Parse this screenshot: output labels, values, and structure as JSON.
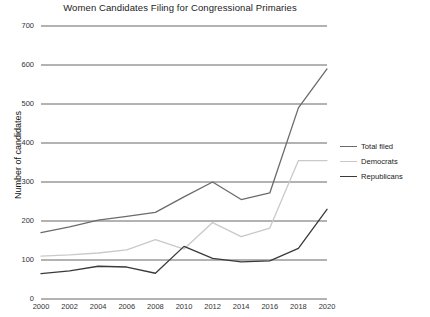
{
  "chart_data": {
    "type": "line",
    "title": "Women Candidates Filing for Congressional Primaries",
    "xlabel": "",
    "ylabel": "Number of candidates",
    "x": [
      2000,
      2002,
      2004,
      2006,
      2008,
      2010,
      2012,
      2014,
      2016,
      2018,
      2020
    ],
    "xticklabels": [
      "2000",
      "2002",
      "2004",
      "2006",
      "2008",
      "2010",
      "2012",
      "2014",
      "2016",
      "2018",
      "2020"
    ],
    "yticks": [
      0,
      100,
      200,
      300,
      400,
      500,
      600,
      700
    ],
    "yticklabels": [
      "0",
      "100",
      "200",
      "300",
      "400",
      "500",
      "600",
      "700"
    ],
    "xlim": [
      2000,
      2020
    ],
    "ylim": [
      0,
      700
    ],
    "grid": "horizontal",
    "legend_position": "right",
    "series": [
      {
        "name": "Total filed",
        "color": "#6b6b6b",
        "values": [
          170,
          185,
          202,
          212,
          222,
          262,
          300,
          255,
          272,
          490,
          590
        ]
      },
      {
        "name": "Democrats",
        "color": "#c9c9c9",
        "values": [
          110,
          113,
          118,
          126,
          152,
          128,
          196,
          160,
          182,
          355,
          355
        ]
      },
      {
        "name": "Republicans",
        "color": "#3a3a3a",
        "values": [
          65,
          72,
          84,
          82,
          66,
          135,
          104,
          95,
          98,
          130,
          230
        ]
      }
    ]
  }
}
